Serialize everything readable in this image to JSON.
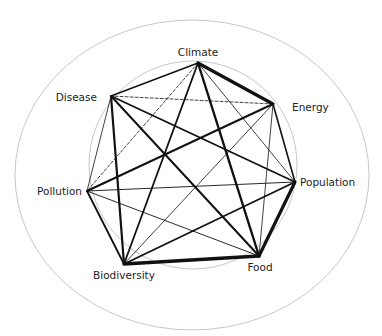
{
  "diagram": {
    "type": "network",
    "outer_ellipse": {
      "cx": 192,
      "cy": 175,
      "rx": 177,
      "ry": 155,
      "stroke": "#c8c8c8"
    },
    "inner_circle": {
      "cx": 193,
      "cy": 165,
      "r": 104,
      "stroke": "#c8c8c8"
    },
    "edge_color": "#111111",
    "nodes": [
      {
        "id": "climate",
        "label": "Climate",
        "x": 198,
        "y": 63,
        "lx": 198,
        "ly": 56,
        "anchor": "middle"
      },
      {
        "id": "energy",
        "label": "Energy",
        "x": 273,
        "y": 104,
        "lx": 292,
        "ly": 111,
        "anchor": "start"
      },
      {
        "id": "population",
        "label": "Population",
        "x": 295,
        "y": 182,
        "lx": 300,
        "ly": 186,
        "anchor": "start"
      },
      {
        "id": "food",
        "label": "Food",
        "x": 259,
        "y": 256,
        "lx": 260,
        "ly": 271,
        "anchor": "middle"
      },
      {
        "id": "biodiversity",
        "label": "Biodiversity",
        "x": 124,
        "y": 264,
        "lx": 124,
        "ly": 279,
        "anchor": "middle"
      },
      {
        "id": "pollution",
        "label": "Pollution",
        "x": 87,
        "y": 191,
        "lx": 82,
        "ly": 195,
        "anchor": "end"
      },
      {
        "id": "disease",
        "label": "Disease",
        "x": 111,
        "y": 96,
        "lx": 97,
        "ly": 101,
        "anchor": "end"
      }
    ],
    "edges": [
      {
        "from": "climate",
        "to": "energy",
        "width": 3.2,
        "dashed": false
      },
      {
        "from": "climate",
        "to": "population",
        "width": 0.8,
        "dashed": false
      },
      {
        "from": "climate",
        "to": "food",
        "width": 2.4,
        "dashed": false
      },
      {
        "from": "climate",
        "to": "biodiversity",
        "width": 1.8,
        "dashed": false
      },
      {
        "from": "climate",
        "to": "pollution",
        "width": 0.8,
        "dashed": true
      },
      {
        "from": "climate",
        "to": "disease",
        "width": 1.4,
        "dashed": false
      },
      {
        "from": "energy",
        "to": "population",
        "width": 1.6,
        "dashed": false
      },
      {
        "from": "energy",
        "to": "food",
        "width": 0.8,
        "dashed": false
      },
      {
        "from": "energy",
        "to": "biodiversity",
        "width": 0.8,
        "dashed": false
      },
      {
        "from": "energy",
        "to": "pollution",
        "width": 2.0,
        "dashed": false
      },
      {
        "from": "energy",
        "to": "disease",
        "width": 0.8,
        "dashed": true
      },
      {
        "from": "population",
        "to": "food",
        "width": 3.2,
        "dashed": false
      },
      {
        "from": "population",
        "to": "biodiversity",
        "width": 1.8,
        "dashed": false
      },
      {
        "from": "population",
        "to": "pollution",
        "width": 0.9,
        "dashed": false
      },
      {
        "from": "population",
        "to": "disease",
        "width": 1.8,
        "dashed": false
      },
      {
        "from": "food",
        "to": "biodiversity",
        "width": 3.4,
        "dashed": false
      },
      {
        "from": "food",
        "to": "pollution",
        "width": 0.9,
        "dashed": false
      },
      {
        "from": "food",
        "to": "disease",
        "width": 2.0,
        "dashed": false
      },
      {
        "from": "biodiversity",
        "to": "pollution",
        "width": 1.8,
        "dashed": false
      },
      {
        "from": "biodiversity",
        "to": "disease",
        "width": 2.2,
        "dashed": false
      },
      {
        "from": "pollution",
        "to": "disease",
        "width": 0.8,
        "dashed": false
      }
    ]
  }
}
